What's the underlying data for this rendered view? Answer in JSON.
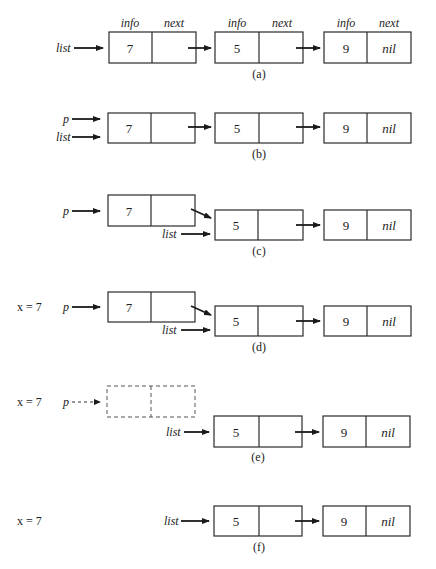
{
  "figure": {
    "headers": {
      "info": "info",
      "next": "next"
    },
    "panels": [
      {
        "id": "a",
        "caption": "(a)",
        "pointers": [
          {
            "label": "list",
            "y": 48
          }
        ],
        "nodes": [
          {
            "info": "7",
            "next": ""
          },
          {
            "info": "5",
            "next": ""
          },
          {
            "info": "9",
            "next": "nil"
          }
        ]
      },
      {
        "id": "b",
        "caption": "(b)",
        "pointers": [
          {
            "label": "p",
            "y": 119
          },
          {
            "label": "list",
            "y": 137
          }
        ],
        "nodes": [
          {
            "info": "7",
            "next": ""
          },
          {
            "info": "5",
            "next": ""
          },
          {
            "info": "9",
            "next": "nil"
          }
        ]
      },
      {
        "id": "c",
        "caption": "(c)",
        "pointers": [
          {
            "label": "p",
            "y": 211
          },
          {
            "label": "list",
            "y": 234
          }
        ],
        "nodes": [
          {
            "info": "7",
            "next": ""
          },
          {
            "info": "5",
            "next": ""
          },
          {
            "info": "9",
            "next": "nil"
          }
        ]
      },
      {
        "id": "d",
        "caption": "(d)",
        "variable": "x = 7",
        "pointers": [
          {
            "label": "p",
            "y": 307
          },
          {
            "label": "list",
            "y": 330
          }
        ],
        "nodes": [
          {
            "info": "7",
            "next": ""
          },
          {
            "info": "5",
            "next": ""
          },
          {
            "info": "9",
            "next": "nil"
          }
        ]
      },
      {
        "id": "e",
        "caption": "(e)",
        "variable": "x = 7",
        "pointers": [
          {
            "label": "p",
            "y": 402,
            "dashed": true
          },
          {
            "label": "list",
            "y": 432
          }
        ],
        "freed_node": {
          "info": "",
          "next": ""
        },
        "nodes": [
          {
            "info": "5",
            "next": ""
          },
          {
            "info": "9",
            "next": "nil"
          }
        ]
      },
      {
        "id": "f",
        "caption": "(f)",
        "variable": "x = 7",
        "pointers": [
          {
            "label": "list",
            "y": 521
          }
        ],
        "nodes": [
          {
            "info": "5",
            "next": ""
          },
          {
            "info": "9",
            "next": "nil"
          }
        ]
      }
    ]
  }
}
